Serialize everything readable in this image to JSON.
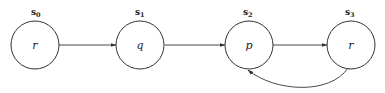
{
  "diagram": {
    "type": "state-transition",
    "states": [
      {
        "id": "s0",
        "name": "s",
        "index": "0",
        "label": "r"
      },
      {
        "id": "s1",
        "name": "s",
        "index": "1",
        "label": "q"
      },
      {
        "id": "s2",
        "name": "s",
        "index": "2",
        "label": "p"
      },
      {
        "id": "s3",
        "name": "s",
        "index": "3",
        "label": "r"
      }
    ],
    "edges": [
      {
        "from": "s0",
        "to": "s1"
      },
      {
        "from": "s1",
        "to": "s2"
      },
      {
        "from": "s2",
        "to": "s3"
      },
      {
        "from": "s3",
        "to": "s2",
        "curved": true
      }
    ]
  }
}
